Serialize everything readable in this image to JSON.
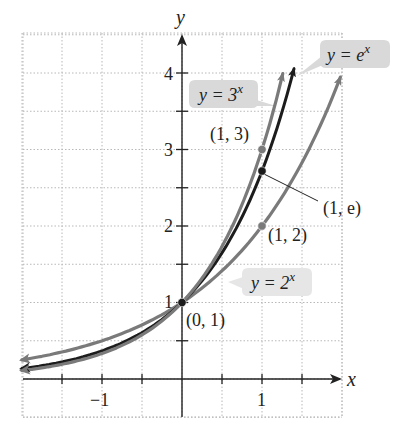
{
  "chart_data": {
    "type": "line",
    "title": "",
    "xlabel": "x",
    "ylabel": "y",
    "xlim": [
      -1.98,
      1.98
    ],
    "ylim": [
      -0.5,
      4.5
    ],
    "grid": true,
    "grid_step": 0.5,
    "x_ticks": [
      -1.5,
      -1,
      -0.5,
      0,
      0.5,
      1,
      1.5
    ],
    "x_tick_labels": [
      {
        "value": -1,
        "label": "−1"
      },
      {
        "value": 1,
        "label": "1"
      }
    ],
    "y_ticks": [
      0.5,
      1,
      1.5,
      2,
      2.5,
      3,
      3.5,
      4
    ],
    "y_tick_labels": [
      {
        "value": 1,
        "label": "1"
      },
      {
        "value": 2,
        "label": "2"
      },
      {
        "value": 3,
        "label": "3"
      },
      {
        "value": 4,
        "label": "4"
      }
    ],
    "series": [
      {
        "name": "y = 2^x",
        "label_base": "y = 2",
        "label_exp": "x",
        "color": "#7a7a7a",
        "base": 2,
        "x_range": [
          -2,
          1.98
        ]
      },
      {
        "name": "y = e^x",
        "label_base": "y = e",
        "label_exp": "x",
        "color": "#1c1c1c",
        "base": 2.718281828,
        "x_range": [
          -2,
          1.4
        ]
      },
      {
        "name": "y = 3^x",
        "label_base": "y = 3",
        "label_exp": "x",
        "color": "#7a7a7a",
        "base": 3,
        "x_range": [
          -2,
          1.26
        ]
      }
    ],
    "points": [
      {
        "x": 0,
        "y": 1,
        "label": "(0, 1)",
        "color": "#1c1c1c"
      },
      {
        "x": 1,
        "y": 3,
        "label": "(1, 3)",
        "color": "#7a7a7a"
      },
      {
        "x": 1,
        "y": 2.718,
        "label": "(1, e)",
        "color": "#1c1c1c"
      },
      {
        "x": 1,
        "y": 2,
        "label": "(1, 2)",
        "color": "#7a7a7a"
      }
    ],
    "annotations": [
      "y = 3^x",
      "y = e^x",
      "y = 2^x",
      "(1, 3)",
      "(1, e)",
      "(1, 2)",
      "(0, 1)"
    ]
  },
  "labels": {
    "x_axis": "x",
    "y_axis": "y",
    "tick_x_neg1": "−1",
    "tick_x_1": "1",
    "tick_y_1": "1",
    "tick_y_2": "2",
    "tick_y_3": "3",
    "tick_y_4": "4",
    "pt_01": "(0, 1)",
    "pt_13": "(1, 3)",
    "pt_1e": "(1, e)",
    "pt_12": "(1, 2)",
    "callout_3x_base": "y = 3",
    "callout_3x_exp": "x",
    "callout_ex_base": "y = e",
    "callout_ex_exp": "x",
    "callout_2x_base": "y = 2",
    "callout_2x_exp": "x"
  },
  "colors": {
    "grid": "#b8b8b8",
    "axis": "#222222",
    "gray_curve": "#7a7a7a",
    "dark_curve": "#1c1c1c",
    "callout_bg": "#d9d9d9"
  }
}
